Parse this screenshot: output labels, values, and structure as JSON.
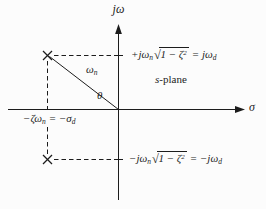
{
  "diagram": {
    "background": "#fcfcfc",
    "ink": "#1c1c1c",
    "axes": {
      "imaginary_label": "jω",
      "real_label": "σ"
    },
    "plane_label": {
      "variable": "s",
      "suffix": "-plane"
    },
    "natural_frequency_label": {
      "base": "ω",
      "sub": "n"
    },
    "angle_label": "θ",
    "sqrt_symbol": "√",
    "pole_marker": "×",
    "upper_pole_annotation": {
      "lead": "+jω",
      "lead_sub": "n",
      "radicand": "1 − ζ",
      "exponent": "2",
      "equals": "= jω",
      "result_sub": "d"
    },
    "lower_pole_annotation": {
      "lead": "−jω",
      "lead_sub": "n",
      "radicand": "1 − ζ",
      "exponent": "2",
      "equals": "= −jω",
      "result_sub": "d"
    },
    "real_axis_annotation": {
      "lead": "−ζω",
      "lead_sub": "n",
      "equals": "= −σ",
      "result_sub": "d"
    }
  }
}
